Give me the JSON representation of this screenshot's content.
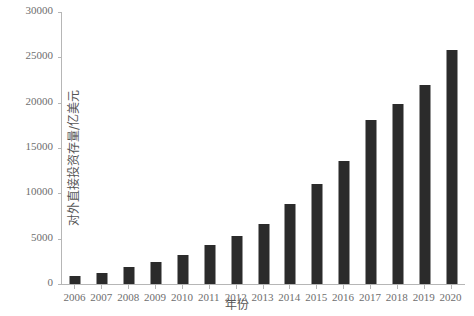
{
  "chart_data": {
    "type": "bar",
    "title": "",
    "xlabel": "年份",
    "ylabel": "对外直接投资存量/亿美元",
    "categories": [
      "2006",
      "2007",
      "2008",
      "2009",
      "2010",
      "2011",
      "2012",
      "2013",
      "2014",
      "2015",
      "2016",
      "2017",
      "2018",
      "2019",
      "2020"
    ],
    "values": [
      900,
      1180,
      1840,
      2460,
      3170,
      4250,
      5320,
      6600,
      8830,
      10980,
      13570,
      18090,
      19820,
      21990,
      25800
    ],
    "ylim": [
      0,
      30000
    ],
    "xlim_note": "categorical years 2006-2020",
    "yticks": [
      0,
      5000,
      10000,
      15000,
      20000,
      25000,
      30000
    ],
    "ytick_labels": [
      "0",
      "5000",
      "10000",
      "15000",
      "20000",
      "25000",
      "30000"
    ],
    "grid": false,
    "legend": null,
    "legend_position": "none",
    "bar_color": "#2b2b2b",
    "axis_color": "#b6b6b6",
    "tick_label_color": "#6e6e6e",
    "axis_label_color": "#555555"
  },
  "axis": {
    "y_label": "对外直接投资存量/亿美元",
    "x_label": "年份"
  }
}
